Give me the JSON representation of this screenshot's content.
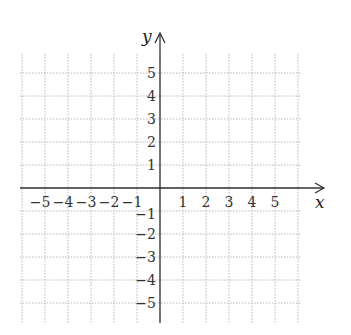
{
  "chart_data": {
    "type": "coordinate-grid",
    "title": "",
    "xlabel": "x",
    "ylabel": "y",
    "xlim": [
      -6,
      6
    ],
    "ylim": [
      -6,
      6
    ],
    "grid": true,
    "grid_style": "dotted",
    "x_ticks": [
      -5,
      -4,
      -3,
      -2,
      -1,
      1,
      2,
      3,
      4,
      5
    ],
    "y_ticks": [
      5,
      4,
      3,
      2,
      1,
      -1,
      -2,
      -3,
      -4,
      -5
    ],
    "x_tick_labels": [
      "−5",
      "−4",
      "−3",
      "−2",
      "−1",
      "1",
      "2",
      "3",
      "4",
      "5"
    ],
    "y_tick_labels": [
      "5",
      "4",
      "3",
      "2",
      "1",
      "−1",
      "−2",
      "−3",
      "−4",
      "−5"
    ],
    "arrows": [
      "x-positive",
      "y-positive"
    ],
    "data_points": []
  },
  "colors": {
    "axis": "#333333",
    "grid": "#b8b8b8",
    "background": "#ffffff"
  },
  "geometry": {
    "origin_x": 160,
    "origin_y": 188,
    "unit": 23,
    "grid_left": 20,
    "grid_right": 301,
    "grid_top": 54,
    "grid_bottom": 323
  }
}
